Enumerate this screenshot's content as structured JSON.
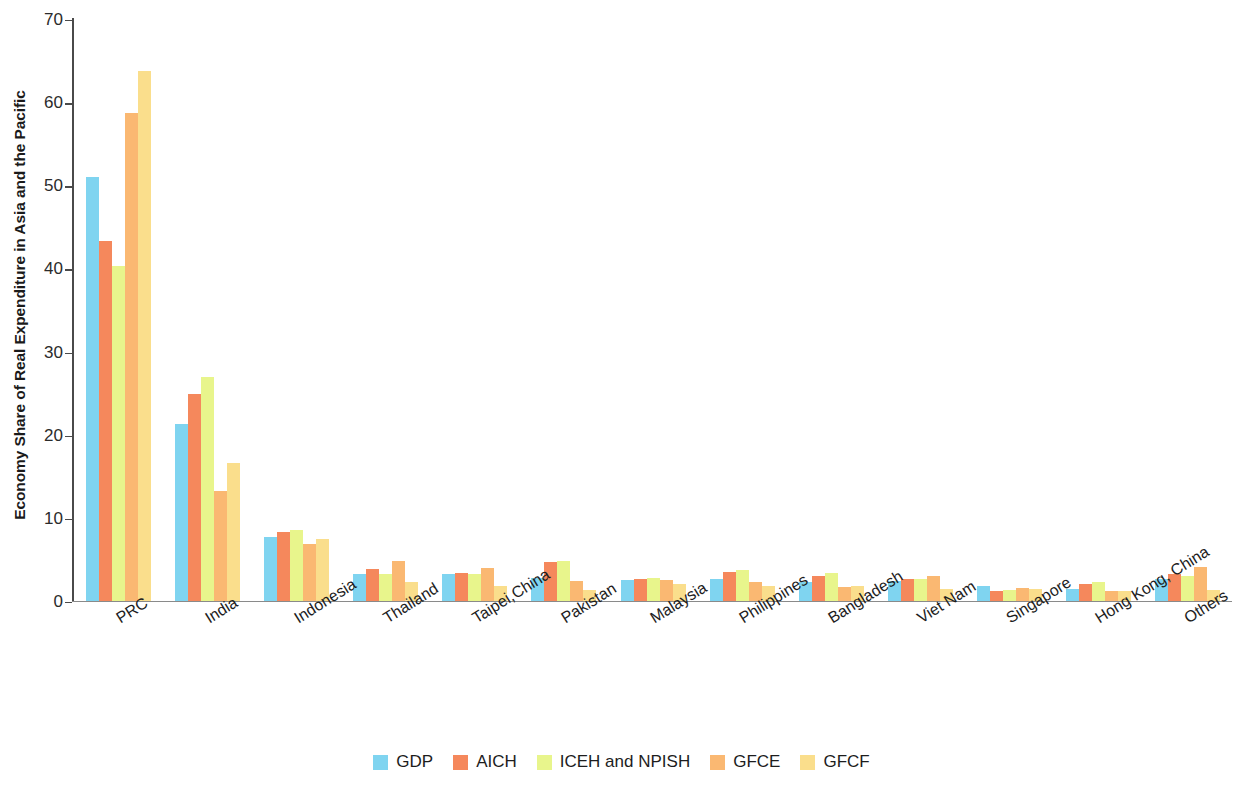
{
  "chart_data": {
    "type": "bar",
    "title": "",
    "xlabel": "",
    "ylabel": "Economy Share of Real Expenditure in Asia and the Pacific",
    "ylim": [
      0,
      70
    ],
    "yticks": [
      0,
      10,
      20,
      30,
      40,
      50,
      60,
      70
    ],
    "grid": false,
    "legend_position": "bottom",
    "categories": [
      "PRC",
      "India",
      "Indonesia",
      "Thailand",
      "Taipei,China",
      "Pakistan",
      "Malaysia",
      "Philippines",
      "Bangladesh",
      "Viet Nam",
      "Singapore",
      "Hong Kong, China",
      "Others"
    ],
    "series": [
      {
        "name": "GDP",
        "color": "#7fd4f0",
        "values": [
          50.9,
          21.3,
          7.7,
          3.2,
          3.2,
          2.7,
          2.5,
          2.6,
          2.3,
          2.4,
          1.8,
          1.4,
          2.6
        ]
      },
      {
        "name": "AICH",
        "color": "#f5885c",
        "values": [
          43.2,
          24.9,
          8.3,
          3.8,
          3.3,
          4.6,
          2.6,
          3.4,
          3.0,
          2.6,
          1.1,
          2.0,
          3.2
        ]
      },
      {
        "name": "ICEH and NPISH",
        "color": "#e8f58c",
        "values": [
          40.2,
          26.9,
          8.5,
          3.2,
          3.2,
          4.8,
          2.7,
          3.7,
          3.3,
          2.6,
          1.3,
          2.2,
          3.0
        ]
      },
      {
        "name": "GFCE",
        "color": "#fab872",
        "values": [
          58.6,
          13.2,
          6.8,
          4.8,
          3.9,
          2.4,
          2.5,
          2.2,
          1.6,
          3.0,
          1.5,
          1.1,
          4.0
        ]
      },
      {
        "name": "GFCF",
        "color": "#fade8c",
        "values": [
          63.7,
          16.6,
          7.4,
          2.2,
          1.7,
          1.3,
          2.0,
          1.8,
          1.7,
          1.4,
          1.4,
          1.1,
          1.3
        ]
      }
    ]
  }
}
